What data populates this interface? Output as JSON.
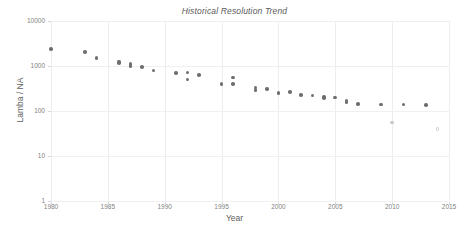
{
  "chart": {
    "title": "Historical Resolution Trend",
    "xlabel": "Year",
    "ylabel": "Lamba / NA"
  },
  "chart_data": {
    "type": "scatter",
    "title": "Historical Resolution Trend",
    "xlabel": "Year",
    "ylabel": "Lamba / NA",
    "xlim": [
      1980,
      2015
    ],
    "ylim": [
      1,
      10000
    ],
    "yscale": "log",
    "xticks": [
      "1980",
      "1985",
      "1990",
      "1995",
      "2000",
      "2005",
      "2010",
      "2015"
    ],
    "yticks": [
      "1",
      "10",
      "100",
      "1000",
      "10000"
    ],
    "grid": true,
    "legend": "none",
    "marker_color": "#6f6f6f",
    "faint_marker_color": "#c9c9c9",
    "series": [
      {
        "name": "Lamba / NA",
        "points": [
          {
            "x": 1980,
            "y": 2400,
            "style": "solid"
          },
          {
            "x": 1983,
            "y": 2050,
            "style": "solid"
          },
          {
            "x": 1984,
            "y": 1500,
            "style": "solid"
          },
          {
            "x": 1986,
            "y": 1250,
            "style": "solid"
          },
          {
            "x": 1986,
            "y": 1150,
            "style": "solid"
          },
          {
            "x": 1987,
            "y": 1100,
            "style": "solid"
          },
          {
            "x": 1987,
            "y": 1000,
            "style": "solid"
          },
          {
            "x": 1988,
            "y": 950,
            "style": "solid"
          },
          {
            "x": 1989,
            "y": 800,
            "style": "solid"
          },
          {
            "x": 1991,
            "y": 700,
            "style": "solid"
          },
          {
            "x": 1992,
            "y": 710,
            "style": "solid"
          },
          {
            "x": 1992,
            "y": 500,
            "style": "solid"
          },
          {
            "x": 1993,
            "y": 630,
            "style": "solid"
          },
          {
            "x": 1995,
            "y": 400,
            "style": "solid"
          },
          {
            "x": 1996,
            "y": 550,
            "style": "solid"
          },
          {
            "x": 1996,
            "y": 395,
            "style": "solid"
          },
          {
            "x": 1998,
            "y": 330,
            "style": "solid"
          },
          {
            "x": 1998,
            "y": 295,
            "style": "solid"
          },
          {
            "x": 1999,
            "y": 310,
            "style": "solid"
          },
          {
            "x": 2000,
            "y": 250,
            "style": "solid"
          },
          {
            "x": 2001,
            "y": 265,
            "style": "solid"
          },
          {
            "x": 2002,
            "y": 230,
            "style": "solid"
          },
          {
            "x": 2003,
            "y": 220,
            "style": "solid"
          },
          {
            "x": 2004,
            "y": 205,
            "style": "solid"
          },
          {
            "x": 2004,
            "y": 195,
            "style": "solid"
          },
          {
            "x": 2005,
            "y": 200,
            "style": "solid"
          },
          {
            "x": 2006,
            "y": 170,
            "style": "solid"
          },
          {
            "x": 2006,
            "y": 160,
            "style": "solid"
          },
          {
            "x": 2007,
            "y": 145,
            "style": "solid"
          },
          {
            "x": 2009,
            "y": 140,
            "style": "solid"
          },
          {
            "x": 2011,
            "y": 138,
            "style": "solid"
          },
          {
            "x": 2013,
            "y": 135,
            "style": "solid"
          },
          {
            "x": 2010,
            "y": 55,
            "style": "faint"
          },
          {
            "x": 2014,
            "y": 40,
            "style": "hollow"
          }
        ]
      }
    ]
  }
}
